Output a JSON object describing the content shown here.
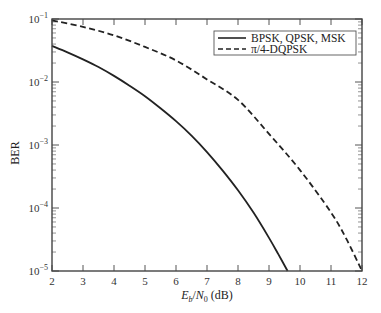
{
  "chart_data": {
    "type": "line",
    "title": "",
    "xlabel": "E_b/N_0 (dB)",
    "xlabel_parts": {
      "E": "E",
      "b": "b",
      "slash": "/",
      "N": "N",
      "zero": "0",
      "unit": " (dB)"
    },
    "ylabel": "BER",
    "xlim": [
      2,
      12
    ],
    "ylim": [
      1e-05,
      0.1
    ],
    "yscale": "log",
    "grid": false,
    "legend_position": "upper right",
    "x_ticks": [
      2,
      3,
      4,
      5,
      6,
      7,
      8,
      9,
      10,
      11,
      12
    ],
    "x_tick_labels": [
      "2",
      "3",
      "4",
      "5",
      "6",
      "7",
      "8",
      "9",
      "10",
      "11",
      "12"
    ],
    "y_ticks": [
      0.1,
      0.01,
      0.001,
      0.0001,
      1e-05
    ],
    "y_tick_labels": [
      {
        "base": "10",
        "exp": "−1"
      },
      {
        "base": "10",
        "exp": "−2"
      },
      {
        "base": "10",
        "exp": "−3"
      },
      {
        "base": "10",
        "exp": "−4"
      },
      {
        "base": "10",
        "exp": "−5"
      }
    ],
    "series": [
      {
        "name": "BPSK, QPSK, MSK",
        "style": "solid",
        "color": "#222222",
        "x": [
          2,
          2.5,
          3,
          3.5,
          4,
          4.5,
          5,
          5.5,
          6,
          6.5,
          7,
          7.5,
          8,
          8.5,
          9,
          9.3,
          9.6
        ],
        "values": [
          0.0375,
          0.0296,
          0.0229,
          0.0173,
          0.0125,
          0.00874,
          0.00595,
          0.00383,
          0.00239,
          0.00141,
          0.000773,
          0.000396,
          0.000191,
          8.45e-05,
          3.36e-05,
          1.85e-05,
          1e-05
        ]
      },
      {
        "name": "π/4-DQPSK",
        "style": "dashed",
        "color": "#222222",
        "x": [
          2,
          3,
          4,
          5,
          6,
          7,
          8,
          9,
          10,
          11,
          11.5,
          12
        ],
        "values": [
          0.095,
          0.075,
          0.055,
          0.036,
          0.022,
          0.011,
          0.0052,
          0.0015,
          0.0004,
          8.5e-05,
          3.2e-05,
          1e-05
        ]
      }
    ]
  },
  "legend": {
    "items": [
      {
        "label": "BPSK, QPSK, MSK",
        "style": "solid"
      },
      {
        "label": "π/4-DQPSK",
        "style": "dashed"
      }
    ]
  }
}
